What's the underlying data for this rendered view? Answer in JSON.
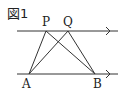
{
  "figure": {
    "title": "図1",
    "points": {
      "P": {
        "label": "P",
        "x": 46,
        "y": 31
      },
      "Q": {
        "label": "Q",
        "x": 68,
        "y": 31
      },
      "A": {
        "label": "A",
        "x": 29,
        "y": 74
      },
      "B": {
        "label": "B",
        "x": 95,
        "y": 74
      }
    },
    "lines": {
      "top": {
        "x1": 17,
        "x2": 118,
        "y": 31,
        "arrow_x": 110
      },
      "bottom": {
        "x1": 17,
        "x2": 118,
        "y": 74,
        "arrow_x": 110
      }
    },
    "segments": [
      "AP",
      "AQ",
      "BP",
      "BQ"
    ],
    "stroke_color": "#333333"
  }
}
